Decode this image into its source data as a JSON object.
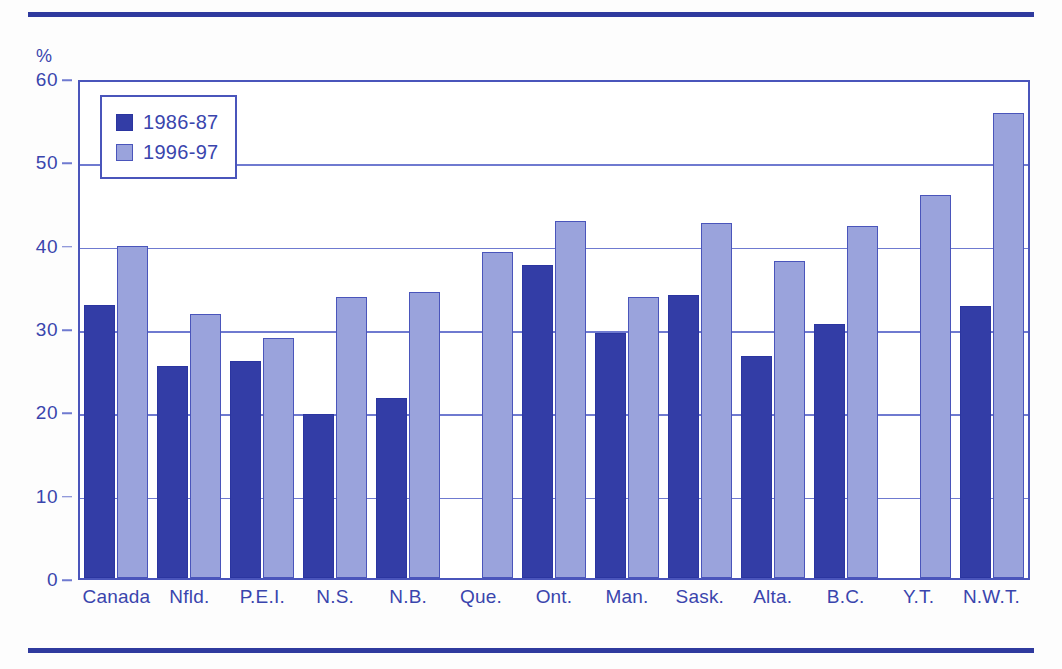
{
  "chart_data": {
    "type": "bar",
    "title": "",
    "xlabel": "",
    "ylabel": "%",
    "ylim": [
      0,
      60
    ],
    "yticks": [
      0,
      10,
      20,
      30,
      40,
      50,
      60
    ],
    "grid": true,
    "legend_position": "top-left",
    "categories": [
      "Canada",
      "Nfld.",
      "P.E.I.",
      "N.S.",
      "N.B.",
      "Que.",
      "Ont.",
      "Man.",
      "Sask.",
      "Alta.",
      "B.C.",
      "Y.T.",
      "N.W.T."
    ],
    "series": [
      {
        "name": "1986-87",
        "color": "#333da6",
        "values": [
          32.8,
          25.5,
          26.0,
          19.7,
          21.6,
          null,
          37.6,
          29.4,
          34.0,
          26.6,
          30.5,
          null,
          32.7
        ]
      },
      {
        "name": "1996-97",
        "color": "#9aa3dc",
        "values": [
          39.8,
          31.7,
          28.8,
          33.7,
          34.3,
          39.1,
          42.9,
          33.7,
          42.6,
          38.1,
          42.2,
          46.0,
          55.8
        ]
      }
    ]
  },
  "legend": {
    "items": [
      {
        "label": "1986-87",
        "swatch": "dark-blue-square"
      },
      {
        "label": "1996-97",
        "swatch": "light-blue-square"
      }
    ]
  },
  "axes": {
    "y_unit": "%",
    "y_tick_labels": [
      "60",
      "50",
      "40",
      "30",
      "20",
      "10",
      "0"
    ],
    "x_tick_labels": [
      "Canada",
      "Nfld.",
      "P.E.I.",
      "N.S.",
      "N.B.",
      "Que.",
      "Ont.",
      "Man.",
      "Sask.",
      "Alta.",
      "B.C.",
      "Y.T.",
      "N.W.T."
    ]
  },
  "colors": {
    "series_1986_87": "#333da6",
    "series_1996_97": "#9aa3dc",
    "axis": "#3a45ad",
    "gridline": "#6f7ad0",
    "rule": "#2f3a9e"
  }
}
